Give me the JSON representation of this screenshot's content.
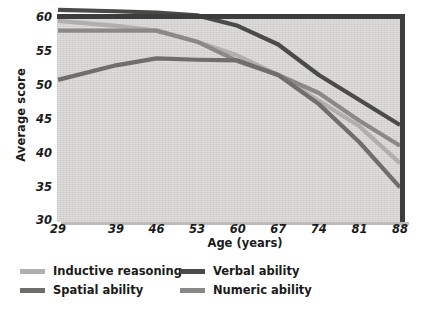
{
  "chart_data": {
    "type": "line",
    "title": "",
    "xlabel": "Age (years)",
    "ylabel": "Average score",
    "x": [
      29,
      39,
      46,
      53,
      60,
      67,
      74,
      81,
      88
    ],
    "xtick_labels": [
      "29",
      "39",
      "46",
      "53",
      "60",
      "67",
      "74",
      "81",
      "88"
    ],
    "ytick_labels": [
      "60",
      "55",
      "50",
      "45",
      "40",
      "35",
      "30"
    ],
    "yticks": [
      60,
      55,
      50,
      45,
      40,
      35,
      30
    ],
    "ylim": [
      30,
      60
    ],
    "grid": false,
    "legend_position": "below-left",
    "series": [
      {
        "name": "Inductive reasoning",
        "color": "#b0afad",
        "values": [
          59.0,
          58.3,
          57.6,
          56.0,
          54.0,
          51.2,
          47.5,
          43.8,
          38.5
        ]
      },
      {
        "name": "Spatial ability",
        "color": "#6f6e6c",
        "values": [
          50.5,
          52.6,
          53.6,
          53.4,
          53.3,
          51.2,
          47.0,
          41.5,
          35.0
        ]
      },
      {
        "name": "Verbal ability",
        "color": "#4a4a48",
        "values": [
          60.6,
          60.4,
          60.2,
          59.8,
          58.3,
          55.6,
          51.2,
          47.6,
          44.0
        ]
      },
      {
        "name": "Numeric ability",
        "color": "#8a8987",
        "values": [
          57.6,
          57.6,
          57.6,
          56.0,
          53.2,
          51.2,
          48.6,
          44.6,
          41.0
        ]
      }
    ]
  },
  "figure": {
    "background_color": "#ffffff",
    "plot_background_color": "#d4d3d1",
    "frame_color": "#3d3d3d"
  }
}
